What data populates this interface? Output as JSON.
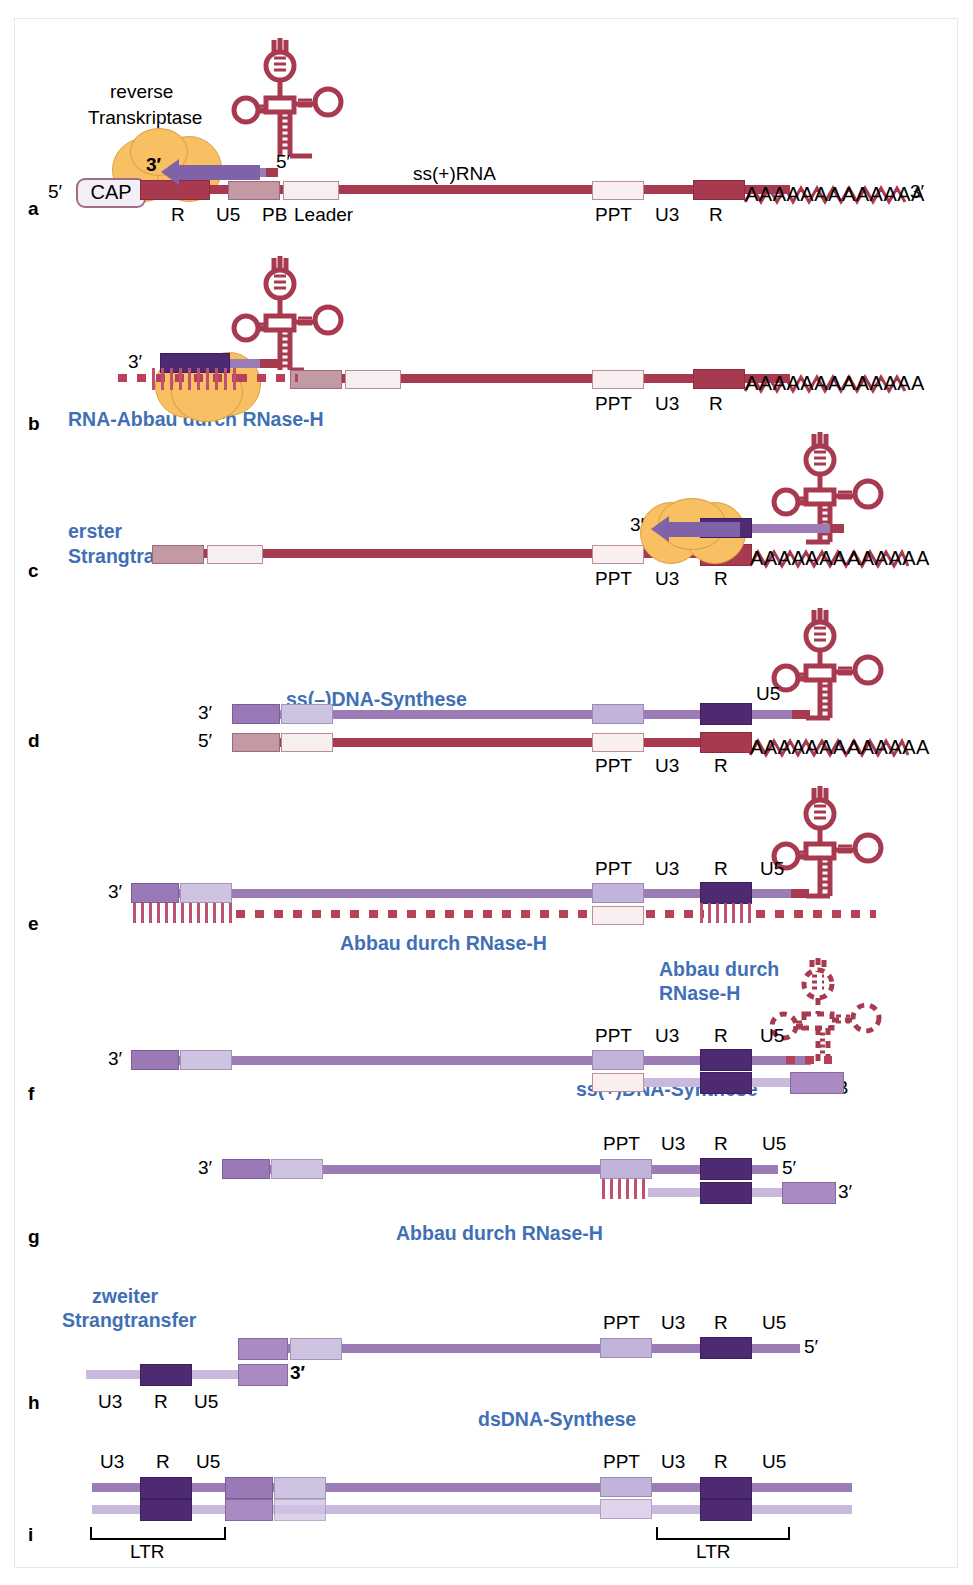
{
  "figure": {
    "colors": {
      "rna": "#a83a50",
      "dna_minus": "#9b7cb5",
      "dna_plus": "#c9b9dd",
      "enzyme": "#f6b64e",
      "annotation_blue": "#3f6fb5",
      "R_rna": "#a83a50",
      "R_dna": "#4e2a72"
    }
  },
  "common": {
    "R": "R",
    "U5": "U5",
    "U3": "U3",
    "PB": "PB",
    "PPT": "PPT",
    "Leader": "Leader",
    "LTR": "LTR",
    "five_prime": "5′",
    "three_prime": "3′",
    "polyA": "AAAAAAAAAAAAA",
    "cap": "CAP"
  },
  "panels": [
    {
      "id": "a",
      "letter": "a",
      "enzyme_label_line1": "reverse",
      "enzyme_label_line2": "Transkriptase",
      "strand_label": "ss(+)RNA",
      "cap": "CAP",
      "five_prime_left": "5′",
      "five_prime_trna": "5′",
      "three_prime_primer": "3′",
      "three_prime_right": "3′",
      "segments": [
        "R",
        "U5",
        "PB",
        "Leader"
      ],
      "segments_right": [
        "PPT",
        "U3",
        "R"
      ],
      "polyA": "AAAAAAAAAAAAA"
    },
    {
      "id": "b",
      "letter": "b",
      "annotation": "RNA-Abbau durch RNase-H",
      "three_prime": "3′",
      "segments_right": [
        "PPT",
        "U3",
        "R"
      ],
      "polyA": "AAAAAAAAAAAAA"
    },
    {
      "id": "c",
      "letter": "c",
      "annotation_line1": "erster",
      "annotation_line2": "Strangtransfer",
      "three_prime": "3′",
      "segments_right": [
        "PPT",
        "U3",
        "R"
      ],
      "polyA": "AAAAAAAAAAAAA"
    },
    {
      "id": "d",
      "letter": "d",
      "annotation": "ss(–)DNA-Synthese",
      "three_prime": "3′",
      "five_prime": "5′",
      "u5_label": "U5",
      "segments_right": [
        "PPT",
        "U3",
        "R"
      ],
      "polyA": "AAAAAAAAAAAAA"
    },
    {
      "id": "e",
      "letter": "e",
      "annotation": "Abbau durch RNase-H",
      "three_prime": "3′",
      "segments_right": [
        "PPT",
        "U3",
        "R",
        "U5"
      ]
    },
    {
      "id": "f",
      "letter": "f",
      "annotation_line1": "Abbau durch",
      "annotation_line2": "RNase-H",
      "annotation_bottom": "ss(+)DNA-Synthese",
      "pb_label": "PB",
      "three_prime": "3′",
      "segments_right": [
        "PPT",
        "U3",
        "R",
        "U5"
      ]
    },
    {
      "id": "g",
      "letter": "g",
      "annotation": "Abbau durch RNase-H",
      "three_prime_left": "3′",
      "five_prime_right": "5′",
      "three_prime_right": "3′",
      "segments_right": [
        "PPT",
        "U3",
        "R",
        "U5"
      ]
    },
    {
      "id": "h",
      "letter": "h",
      "annotation_line1": "zweiter",
      "annotation_line2": "Strangtransfer",
      "three_prime": "3′",
      "five_prime_right": "5′",
      "segments_left": [
        "U3",
        "R",
        "U5"
      ],
      "segments_right": [
        "PPT",
        "U3",
        "R",
        "U5"
      ]
    },
    {
      "id": "i",
      "letter": "i",
      "annotation": "dsDNA-Synthese",
      "ltr_left": "LTR",
      "ltr_right": "LTR",
      "segments_left": [
        "U3",
        "R",
        "U5"
      ],
      "segments_right": [
        "PPT",
        "U3",
        "R",
        "U5"
      ]
    }
  ]
}
